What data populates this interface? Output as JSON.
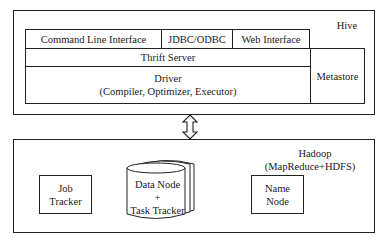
{
  "hive": {
    "label": "Hive",
    "interfaces": [
      {
        "label": "Command Line Interface"
      },
      {
        "label": "JDBC/ODBC"
      },
      {
        "label": "Web Interface"
      }
    ],
    "thrift_server": "Thrift Server",
    "driver": {
      "title": "Driver",
      "subtitle": "(Compiler, Optimizer, Executor)"
    },
    "metastore": "Metastore"
  },
  "connector": {
    "icon": "bidirectional-arrow-icon"
  },
  "hadoop": {
    "title": "Hadoop",
    "subtitle": "(MapReduce+HDFS)",
    "job_tracker": {
      "line1": "Job",
      "line2": "Tracker"
    },
    "data_node": {
      "line1": "Data Node",
      "line2": "+",
      "line3": "Task Tracker"
    },
    "name_node": {
      "line1": "Name",
      "line2": "Node"
    }
  }
}
